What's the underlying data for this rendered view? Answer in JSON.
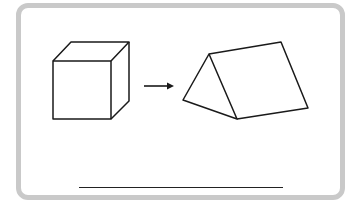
{
  "card": {
    "frame_color": "#c9c9c9",
    "stroke_color": "#1a1a1a"
  },
  "figures": [
    {
      "name": "cube",
      "shape": "cube"
    },
    {
      "name": "arrow",
      "shape": "right-arrow"
    },
    {
      "name": "triangular-prism",
      "shape": "triangular-prism"
    }
  ],
  "answer": {
    "value": ""
  }
}
